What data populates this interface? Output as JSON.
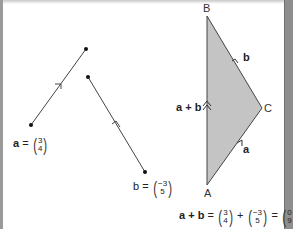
{
  "vectors": {
    "a": {
      "label": "a",
      "x": "3",
      "y": "4"
    },
    "b": {
      "label": "b",
      "x": "−3",
      "y": "5"
    }
  },
  "triangle": {
    "points": {
      "A": "A",
      "B": "B",
      "C": "C"
    },
    "edge_labels": {
      "a": "a",
      "b": "b",
      "sum": "a + b"
    },
    "fill_color": "#c4c4c4"
  },
  "equation": {
    "lhs": "a + b",
    "eq1": "=",
    "plus": "+",
    "eq2": "=",
    "v1": {
      "x": "3",
      "y": "4"
    },
    "v2": {
      "x": "−3",
      "y": "5"
    },
    "result": {
      "x": "0",
      "y": "9"
    }
  },
  "labels": {
    "eq": "=",
    "open": "(",
    "close": ")"
  }
}
